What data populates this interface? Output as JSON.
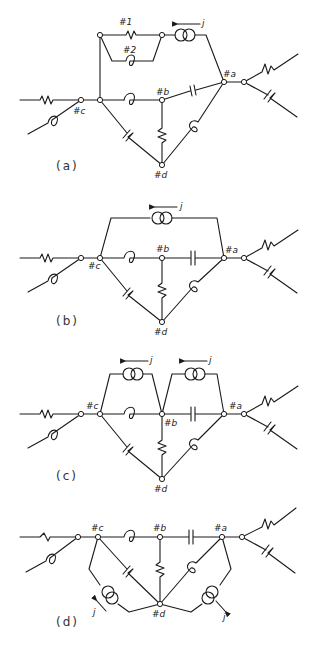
{
  "figure": {
    "diagrams": [
      {
        "id": "a",
        "caption": "(a)",
        "nodes": {
          "a": "#a",
          "b": "#b",
          "c": "#c",
          "d": "#d"
        },
        "branch_labels": {
          "branch1": "#1",
          "branch2": "#2"
        },
        "current_source": {
          "label": "j",
          "direction": "left"
        }
      },
      {
        "id": "b",
        "caption": "(b)",
        "nodes": {
          "a": "#a",
          "b": "#b",
          "c": "#c",
          "d": "#d"
        },
        "current_source": {
          "label": "j",
          "direction": "left"
        }
      },
      {
        "id": "c",
        "caption": "(c)",
        "nodes": {
          "a": "#a",
          "b": "#b",
          "c": "#c",
          "d": "#d"
        },
        "current_sources": [
          {
            "label": "j",
            "direction": "left"
          },
          {
            "label": "j",
            "direction": "left"
          }
        ]
      },
      {
        "id": "d",
        "caption": "(d)",
        "nodes": {
          "a": "#a",
          "b": "#b",
          "c": "#c",
          "d": "#d"
        },
        "current_sources": [
          {
            "label": "j",
            "direction": "up-left"
          },
          {
            "label": "j",
            "direction": "down-right"
          }
        ]
      }
    ]
  }
}
